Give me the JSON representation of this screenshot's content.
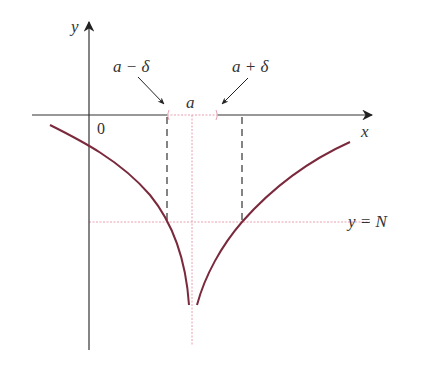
{
  "diagram": {
    "axes": {
      "x_label": "x",
      "y_label": "y",
      "origin_label": "0"
    },
    "labels": {
      "a": "a",
      "a_minus_delta": "a − δ",
      "a_plus_delta": "a + δ",
      "horizontal_line": "y = N"
    },
    "colors": {
      "axis": "#333333",
      "curve": "#7a2a3c",
      "guide": "#e8a0b0",
      "dashed": "#333333",
      "text": "#333333"
    },
    "geometry": {
      "x_axis_y": 115,
      "y_axis_x": 89,
      "a_x": 192,
      "a_minus_delta_x": 167,
      "a_plus_delta_x": 242,
      "N_y": 222
    }
  }
}
